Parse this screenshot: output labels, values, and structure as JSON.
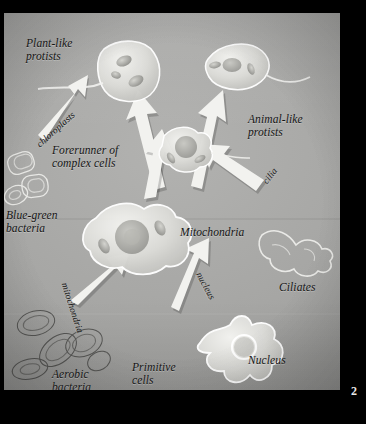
{
  "page": {
    "folio": "2",
    "background_color": "#000000",
    "plate_color": "#a6a6a4",
    "ink_color": "#141414"
  },
  "diagram": {
    "type": "biology-flow-diagram",
    "labels": [
      {
        "id": "plant-like-protists",
        "text": "Plant-like\nprotists",
        "x": 22,
        "y": 24,
        "rotation": 0,
        "style": "italic"
      },
      {
        "id": "chloroplasts",
        "text": "chloroplasts",
        "x": 30,
        "y": 128,
        "rotation": -42,
        "style": "italic-rotated"
      },
      {
        "id": "forerunner",
        "text": "Forerunner of\ncomplex cells",
        "x": 48,
        "y": 131,
        "rotation": 0,
        "style": "italic"
      },
      {
        "id": "blue-green-bacteria",
        "text": "Blue-green\nbacteria",
        "x": 2,
        "y": 196,
        "rotation": 0,
        "style": "italic"
      },
      {
        "id": "animal-like-protists",
        "text": "Animal-like\nprotists",
        "x": 244,
        "y": 100,
        "rotation": 0,
        "style": "italic"
      },
      {
        "id": "cilia",
        "text": "cilia",
        "x": 256,
        "y": 166,
        "rotation": -52,
        "style": "italic-rotated"
      },
      {
        "id": "mitochondria-center",
        "text": "Mitochondria",
        "x": 176,
        "y": 213,
        "rotation": 0,
        "style": "italic"
      },
      {
        "id": "ciliates",
        "text": "Ciliates",
        "x": 275,
        "y": 268,
        "rotation": 0,
        "style": "italic"
      },
      {
        "id": "nucleus-arrow",
        "text": "nucleus",
        "x": 200,
        "y": 257,
        "rotation": 62,
        "style": "italic-rotated"
      },
      {
        "id": "mitochondria-arrow",
        "text": "mitochondria",
        "x": 66,
        "y": 268,
        "rotation": 72,
        "style": "italic-rotated"
      },
      {
        "id": "aerobic-bacteria",
        "text": "Aerobic\nbacteria",
        "x": 48,
        "y": 355,
        "rotation": 0,
        "style": "italic"
      },
      {
        "id": "primitive-cells",
        "text": "Primitive\ncells",
        "x": 128,
        "y": 348,
        "rotation": 0,
        "style": "italic"
      },
      {
        "id": "nucleus-label",
        "text": "Nucleus",
        "x": 244,
        "y": 341,
        "rotation": 0,
        "style": "italic"
      }
    ],
    "organisms": [
      {
        "id": "plant-like-protist-cell",
        "label": "Plant-like protist",
        "shape": "flagellated-rounded-cell"
      },
      {
        "id": "animal-like-protist-cell",
        "label": "Animal-like protist",
        "shape": "flagellated-oval-cell"
      },
      {
        "id": "forerunner-cell",
        "label": "Forerunner of complex cells",
        "shape": "small-amoeboid-cell"
      },
      {
        "id": "complex-amoeboid-cell",
        "label": "Cell with mitochondria",
        "shape": "large-amoeboid-cell"
      },
      {
        "id": "primitive-cell",
        "label": "Primitive cell",
        "shape": "star-amoeboid-cell"
      },
      {
        "id": "blue-green-bacteria-cluster",
        "label": "Blue-green bacteria",
        "shape": "rod-bacteria-cluster"
      },
      {
        "id": "aerobic-bacteria-cluster",
        "label": "Aerobic bacteria",
        "shape": "oval-bacteria-cluster"
      },
      {
        "id": "ciliate-organism",
        "label": "Ciliate",
        "shape": "ciliate-outline"
      }
    ],
    "arrows": [
      {
        "id": "arrow-chloroplasts",
        "from": "blue-green-bacteria",
        "to": "plant-like-protists",
        "annotation": "chloroplasts"
      },
      {
        "id": "arrow-to-plant",
        "from": "forerunner-cell",
        "to": "plant-like-protist-cell",
        "annotation": ""
      },
      {
        "id": "arrow-to-animal",
        "from": "forerunner-cell",
        "to": "animal-like-protist-cell",
        "annotation": ""
      },
      {
        "id": "arrow-cilia",
        "from": "ciliates",
        "to": "forerunner-cell",
        "annotation": "cilia"
      },
      {
        "id": "arrow-up-center",
        "from": "complex-amoeboid-cell",
        "to": "forerunner-cell",
        "annotation": ""
      },
      {
        "id": "arrow-mitochondria",
        "from": "aerobic-bacteria",
        "to": "complex-amoeboid-cell",
        "annotation": "mitochondria"
      },
      {
        "id": "arrow-nucleus",
        "from": "primitive-cells",
        "to": "complex-amoeboid-cell",
        "annotation": "nucleus"
      }
    ]
  }
}
